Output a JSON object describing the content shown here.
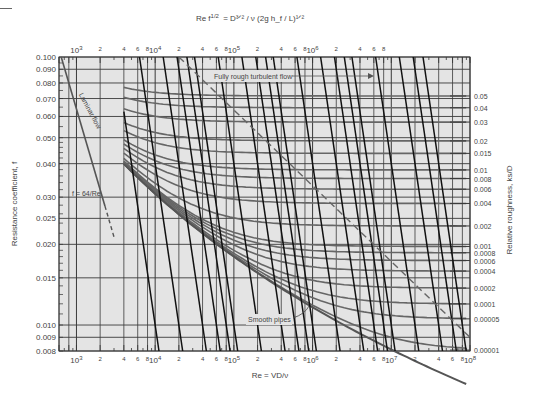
{
  "chart_data": {
    "type": "line",
    "top_axis_label": "Re f^1/2 = (D^3/2 / ν)(2g h_f / L)^1/2",
    "xlabel": "Re = VD/ν",
    "ylabel": "Resistance coefficient, f",
    "right_axis_label": "Relative roughness, k_s/D",
    "x_scale": "log",
    "y_scale": "log",
    "xlim": [
      600,
      100000000
    ],
    "ylim": [
      0.008,
      0.1
    ],
    "grid": true,
    "bottom_ticks": {
      "major": [
        "10^3",
        "10^4",
        "10^5",
        "10^6",
        "10^7",
        "10^8"
      ],
      "minor_labels": [
        "2",
        "4",
        "6",
        "8"
      ]
    },
    "top_ticks": {
      "major": [
        "10^3",
        "10^4",
        "10^5",
        "10^6"
      ],
      "minor_labels": [
        "2",
        "4",
        "6",
        "8"
      ]
    },
    "y_ticks": [
      "0.100",
      "0.090",
      "0.080",
      "0.070",
      "0.060",
      "0.050",
      "0.040",
      "0.030",
      "0.025",
      "0.020",
      "0.015",
      "0.010",
      "0.009",
      "0.008"
    ],
    "y_tick_values": [
      0.1,
      0.09,
      0.08,
      0.07,
      0.06,
      0.05,
      0.04,
      0.03,
      0.025,
      0.02,
      0.015,
      0.01,
      0.009,
      0.008
    ],
    "roughness_ticks": [
      "0.05",
      "0.04",
      "0.03",
      "0.02",
      "0.015",
      "0.01",
      "0.008",
      "0.006",
      "0.004",
      "0.002",
      "0.001",
      "0.0008",
      "0.0006",
      "0.0004",
      "0.0002",
      "0.0001",
      "0.00005",
      "0.00001"
    ],
    "roughness_values": [
      0.05,
      0.04,
      0.03,
      0.02,
      0.015,
      0.01,
      0.008,
      0.006,
      0.004,
      0.002,
      0.001,
      0.0008,
      0.0006,
      0.0004,
      0.0002,
      0.0001,
      5e-05,
      1e-05
    ],
    "series": [
      {
        "name": "Laminar flow",
        "formula": "f = 64/Re",
        "x": [
          640,
          2300
        ],
        "y": [
          0.1,
          0.0278
        ]
      },
      {
        "name": "Laminar extension (dashed)",
        "x": [
          2300,
          3000
        ],
        "y": [
          0.0278,
          0.0213
        ]
      },
      {
        "name": "Smooth pipes",
        "x": [
          4000,
          10000,
          100000,
          1000000,
          10000000,
          100000000
        ],
        "y": [
          0.04,
          0.031,
          0.018,
          0.0116,
          0.0081,
          0.0059
        ]
      },
      {
        "name": "Fully rough boundary (dashed)",
        "x": [
          20000,
          100000000
        ],
        "y": [
          0.1,
          0.009
        ]
      }
    ],
    "annotations": [
      "Laminar flow",
      "f = 64/Re",
      "Fully rough turbulent flow",
      "Smooth pipes"
    ],
    "colors": {
      "background": "#e4e4e4",
      "grid": "#3a3a3a",
      "curve": "#666666",
      "rf_line": "#111111"
    }
  },
  "labels": {
    "top_formula_lhs": "Re f",
    "top_formula_sup": "1/2",
    "top_formula_eq": "=",
    "x_formula_lhs": "Re =",
    "x_formula_num": "VD",
    "x_formula_den": "ν",
    "ylabel": "Resistance coefficient, f",
    "right_label": "Relative roughness,",
    "right_ks": "k",
    "right_ks_sub": "s",
    "right_D": "D",
    "laminar": "Laminar flow",
    "laminar_formula_f": "f =",
    "laminar_formula_num": "64",
    "laminar_formula_den": "Re",
    "fully_rough": "Fully rough turbulent flow",
    "smooth": "Smooth pipes"
  }
}
